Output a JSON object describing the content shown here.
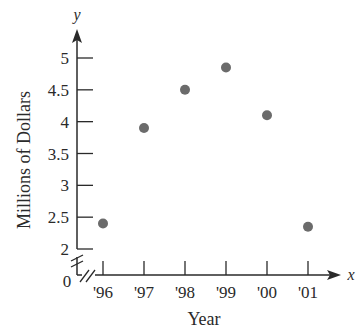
{
  "chart_data": {
    "type": "scatter",
    "title": "",
    "xlabel": "Year",
    "ylabel": "Millions of Dollars",
    "x_axis_var": "x",
    "y_axis_var": "y",
    "categories": [
      "'96",
      "'97",
      "'98",
      "'99",
      "'00",
      "'01"
    ],
    "x": [
      1996,
      1997,
      1998,
      1999,
      2000,
      2001
    ],
    "values": [
      2.4,
      3.9,
      4.5,
      4.85,
      4.1,
      2.35
    ],
    "y_ticks": [
      {
        "value": 2,
        "label": "2"
      },
      {
        "value": 2.5,
        "label": "2.5"
      },
      {
        "value": 3,
        "label": "3"
      },
      {
        "value": 3.5,
        "label": "3.5"
      },
      {
        "value": 4,
        "label": "4"
      },
      {
        "value": 4.5,
        "label": "4.5"
      },
      {
        "value": 5,
        "label": "5"
      }
    ],
    "origin_label": "0",
    "ylim": [
      0,
      5.3
    ],
    "axis_break": true,
    "grid": false,
    "legend": null,
    "marker_color": "#6b6b6b",
    "axis_color": "#2a2a2a"
  }
}
